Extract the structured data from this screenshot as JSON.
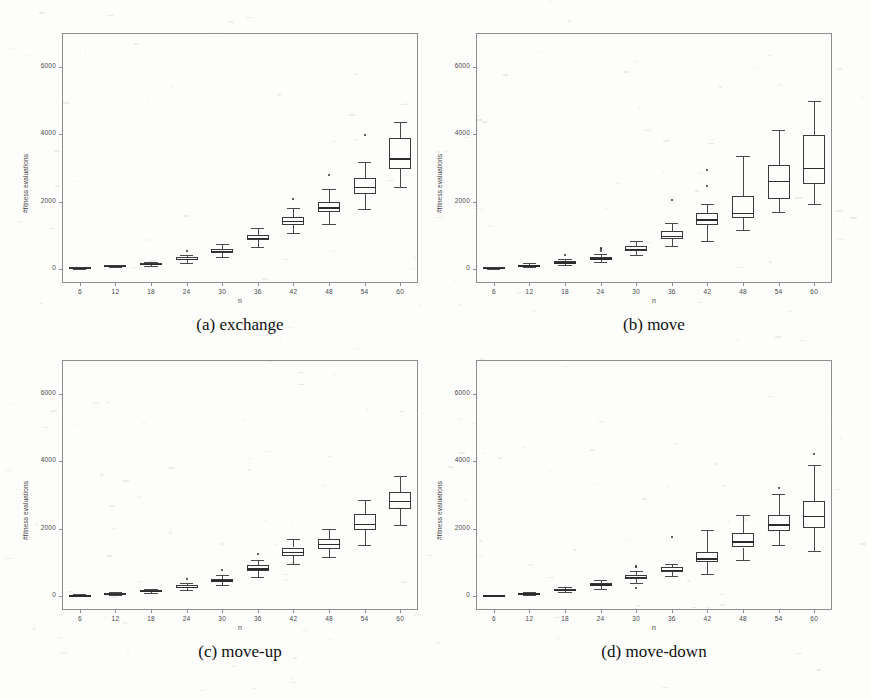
{
  "figure": {
    "width": 871,
    "height": 699,
    "background": "#fdfdfc",
    "axis_color": "#8e8e8e",
    "box_color": "#3a3a3a"
  },
  "panels": [
    {
      "id": "panel-a",
      "caption": "(a) exchange",
      "xlabel": "n",
      "ylabel": "#fitness evaluations",
      "frame": {
        "left": 62,
        "top": 33,
        "width": 356,
        "height": 250
      }
    },
    {
      "id": "panel-b",
      "caption": "(b) move",
      "xlabel": "n",
      "ylabel": "#fitness evaluations",
      "frame": {
        "left": 476,
        "top": 33,
        "width": 356,
        "height": 250
      }
    },
    {
      "id": "panel-c",
      "caption": "(c) move-up",
      "xlabel": "n",
      "ylabel": "#fitness evaluations",
      "frame": {
        "left": 62,
        "top": 360,
        "width": 356,
        "height": 250
      }
    },
    {
      "id": "panel-d",
      "caption": "(d) move-down",
      "xlabel": "n",
      "ylabel": "#fitness evaluations",
      "frame": {
        "left": 476,
        "top": 360,
        "width": 356,
        "height": 250
      }
    }
  ],
  "chart_data": [
    {
      "type": "box",
      "id": "panel-a",
      "title": "(a) exchange",
      "xlabel": "n",
      "ylabel": "#fitness evaluations",
      "ylim": [
        -400,
        7000
      ],
      "yticks": [
        0,
        2000,
        4000,
        6000
      ],
      "ytick_labels": [
        "0",
        "2000",
        "4000",
        "6000"
      ],
      "categories": [
        6,
        12,
        18,
        24,
        30,
        36,
        42,
        48,
        54,
        60
      ],
      "xtick_labels": [
        "6",
        "12",
        "18",
        "24",
        "30",
        "36",
        "42",
        "48",
        "54",
        "60"
      ],
      "grid": false,
      "legend": null,
      "boxes": [
        {
          "x": 6,
          "whislo": 20,
          "q1": 35,
          "med": 50,
          "q3": 65,
          "whishi": 80,
          "fliers": []
        },
        {
          "x": 12,
          "whislo": 70,
          "q1": 90,
          "med": 105,
          "q3": 120,
          "whishi": 140,
          "fliers": []
        },
        {
          "x": 18,
          "whislo": 110,
          "q1": 145,
          "med": 170,
          "q3": 195,
          "whishi": 230,
          "fliers": []
        },
        {
          "x": 24,
          "whislo": 200,
          "q1": 270,
          "med": 310,
          "q3": 355,
          "whishi": 430,
          "fliers": [
            540
          ]
        },
        {
          "x": 30,
          "whislo": 380,
          "q1": 500,
          "med": 555,
          "q3": 620,
          "whishi": 760,
          "fliers": []
        },
        {
          "x": 36,
          "whislo": 660,
          "q1": 860,
          "med": 940,
          "q3": 1030,
          "whishi": 1240,
          "fliers": []
        },
        {
          "x": 42,
          "whislo": 1080,
          "q1": 1330,
          "med": 1440,
          "q3": 1560,
          "whishi": 1830,
          "fliers": [
            2080
          ]
        },
        {
          "x": 48,
          "whislo": 1360,
          "q1": 1700,
          "med": 1840,
          "q3": 2010,
          "whishi": 2380,
          "fliers": [
            2800
          ]
        },
        {
          "x": 54,
          "whislo": 1790,
          "q1": 2230,
          "med": 2450,
          "q3": 2720,
          "whishi": 3180,
          "fliers": [
            3980
          ]
        },
        {
          "x": 60,
          "whislo": 2430,
          "q1": 2960,
          "med": 3290,
          "q3": 3900,
          "whishi": 4360,
          "fliers": []
        }
      ]
    },
    {
      "type": "box",
      "id": "panel-b",
      "title": "(b) move",
      "xlabel": "n",
      "ylabel": "#fitness evaluations",
      "ylim": [
        -400,
        7000
      ],
      "yticks": [
        0,
        2000,
        4000,
        6000
      ],
      "ytick_labels": [
        "0",
        "2000",
        "4000",
        "6000"
      ],
      "categories": [
        6,
        12,
        18,
        24,
        30,
        36,
        42,
        48,
        54,
        60
      ],
      "xtick_labels": [
        "6",
        "12",
        "18",
        "24",
        "30",
        "36",
        "42",
        "48",
        "54",
        "60"
      ],
      "grid": false,
      "legend": null,
      "boxes": [
        {
          "x": 6,
          "whislo": 15,
          "q1": 30,
          "med": 45,
          "q3": 60,
          "whishi": 80,
          "fliers": []
        },
        {
          "x": 12,
          "whislo": 60,
          "q1": 95,
          "med": 120,
          "q3": 145,
          "whishi": 185,
          "fliers": []
        },
        {
          "x": 18,
          "whislo": 130,
          "q1": 185,
          "med": 215,
          "q3": 250,
          "whishi": 310,
          "fliers": [
            420
          ]
        },
        {
          "x": 24,
          "whislo": 215,
          "q1": 290,
          "med": 330,
          "q3": 375,
          "whishi": 450,
          "fliers": [
            560,
            610,
            650
          ]
        },
        {
          "x": 30,
          "whislo": 430,
          "q1": 560,
          "med": 620,
          "q3": 690,
          "whishi": 850,
          "fliers": []
        },
        {
          "x": 36,
          "whislo": 700,
          "q1": 900,
          "med": 1000,
          "q3": 1140,
          "whishi": 1390,
          "fliers": [
            2060
          ]
        },
        {
          "x": 42,
          "whislo": 830,
          "q1": 1320,
          "med": 1490,
          "q3": 1680,
          "whishi": 1930,
          "fliers": [
            2470,
            2950
          ]
        },
        {
          "x": 48,
          "whislo": 1170,
          "q1": 1520,
          "med": 1680,
          "q3": 2180,
          "whishi": 3360,
          "fliers": []
        },
        {
          "x": 54,
          "whislo": 1690,
          "q1": 2100,
          "med": 2630,
          "q3": 3090,
          "whishi": 4120,
          "fliers": []
        },
        {
          "x": 60,
          "whislo": 1950,
          "q1": 2520,
          "med": 3010,
          "q3": 3980,
          "whishi": 4980,
          "fliers": []
        }
      ]
    },
    {
      "type": "box",
      "id": "panel-c",
      "title": "(c) move-up",
      "xlabel": "n",
      "ylabel": "#fitness evaluations",
      "ylim": [
        -400,
        7000
      ],
      "yticks": [
        0,
        2000,
        4000,
        6000
      ],
      "ytick_labels": [
        "0",
        "2000",
        "4000",
        "6000"
      ],
      "categories": [
        6,
        12,
        18,
        24,
        30,
        36,
        42,
        48,
        54,
        60
      ],
      "xtick_labels": [
        "6",
        "12",
        "18",
        "24",
        "30",
        "36",
        "42",
        "48",
        "54",
        "60"
      ],
      "grid": false,
      "legend": null,
      "boxes": [
        {
          "x": 6,
          "whislo": 10,
          "q1": 25,
          "med": 35,
          "q3": 48,
          "whishi": 62,
          "fliers": []
        },
        {
          "x": 12,
          "whislo": 50,
          "q1": 70,
          "med": 85,
          "q3": 100,
          "whishi": 125,
          "fliers": []
        },
        {
          "x": 18,
          "whislo": 100,
          "q1": 140,
          "med": 165,
          "q3": 190,
          "whishi": 235,
          "fliers": []
        },
        {
          "x": 24,
          "whislo": 180,
          "q1": 245,
          "med": 285,
          "q3": 330,
          "whishi": 400,
          "fliers": [
            520
          ]
        },
        {
          "x": 30,
          "whislo": 330,
          "q1": 430,
          "med": 480,
          "q3": 530,
          "whishi": 640,
          "fliers": [
            790
          ]
        },
        {
          "x": 36,
          "whislo": 590,
          "q1": 760,
          "med": 830,
          "q3": 920,
          "whishi": 1080,
          "fliers": [
            1270
          ]
        },
        {
          "x": 42,
          "whislo": 960,
          "q1": 1190,
          "med": 1320,
          "q3": 1450,
          "whishi": 1700,
          "fliers": []
        },
        {
          "x": 48,
          "whislo": 1180,
          "q1": 1420,
          "med": 1560,
          "q3": 1700,
          "whishi": 1990,
          "fliers": []
        },
        {
          "x": 54,
          "whislo": 1530,
          "q1": 1960,
          "med": 2160,
          "q3": 2450,
          "whishi": 2860,
          "fliers": []
        },
        {
          "x": 60,
          "whislo": 2130,
          "q1": 2600,
          "med": 2840,
          "q3": 3080,
          "whishi": 3560,
          "fliers": []
        }
      ]
    },
    {
      "type": "box",
      "id": "panel-d",
      "title": "(d) move-down",
      "xlabel": "n",
      "ylabel": "#fitness evaluations",
      "ylim": [
        -400,
        7000
      ],
      "yticks": [
        0,
        2000,
        4000,
        6000
      ],
      "ytick_labels": [
        "0",
        "2000",
        "4000",
        "6000"
      ],
      "categories": [
        6,
        12,
        18,
        24,
        30,
        36,
        42,
        48,
        54,
        60
      ],
      "xtick_labels": [
        "6",
        "12",
        "18",
        "24",
        "30",
        "36",
        "42",
        "48",
        "54",
        "60"
      ],
      "grid": false,
      "legend": null,
      "boxes": [
        {
          "x": 6,
          "whislo": 10,
          "q1": 22,
          "med": 32,
          "q3": 44,
          "whishi": 58,
          "fliers": []
        },
        {
          "x": 12,
          "whislo": 55,
          "q1": 75,
          "med": 90,
          "q3": 108,
          "whishi": 135,
          "fliers": []
        },
        {
          "x": 18,
          "whislo": 120,
          "q1": 165,
          "med": 195,
          "q3": 225,
          "whishi": 275,
          "fliers": []
        },
        {
          "x": 24,
          "whislo": 210,
          "q1": 300,
          "med": 355,
          "q3": 410,
          "whishi": 500,
          "fliers": []
        },
        {
          "x": 30,
          "whislo": 400,
          "q1": 520,
          "med": 580,
          "q3": 650,
          "whishi": 760,
          "fliers": [
            240,
            860,
            900
          ]
        },
        {
          "x": 36,
          "whislo": 620,
          "q1": 730,
          "med": 790,
          "q3": 860,
          "whishi": 970,
          "fliers": [
            1760
          ]
        },
        {
          "x": 42,
          "whislo": 680,
          "q1": 1010,
          "med": 1130,
          "q3": 1320,
          "whishi": 1980,
          "fliers": []
        },
        {
          "x": 48,
          "whislo": 1080,
          "q1": 1450,
          "med": 1630,
          "q3": 1890,
          "whishi": 2410,
          "fliers": []
        },
        {
          "x": 54,
          "whislo": 1510,
          "q1": 1950,
          "med": 2140,
          "q3": 2420,
          "whishi": 3030,
          "fliers": [
            3200
          ]
        },
        {
          "x": 60,
          "whislo": 1340,
          "q1": 2020,
          "med": 2380,
          "q3": 2830,
          "whishi": 3900,
          "fliers": [
            4230
          ]
        }
      ]
    }
  ]
}
